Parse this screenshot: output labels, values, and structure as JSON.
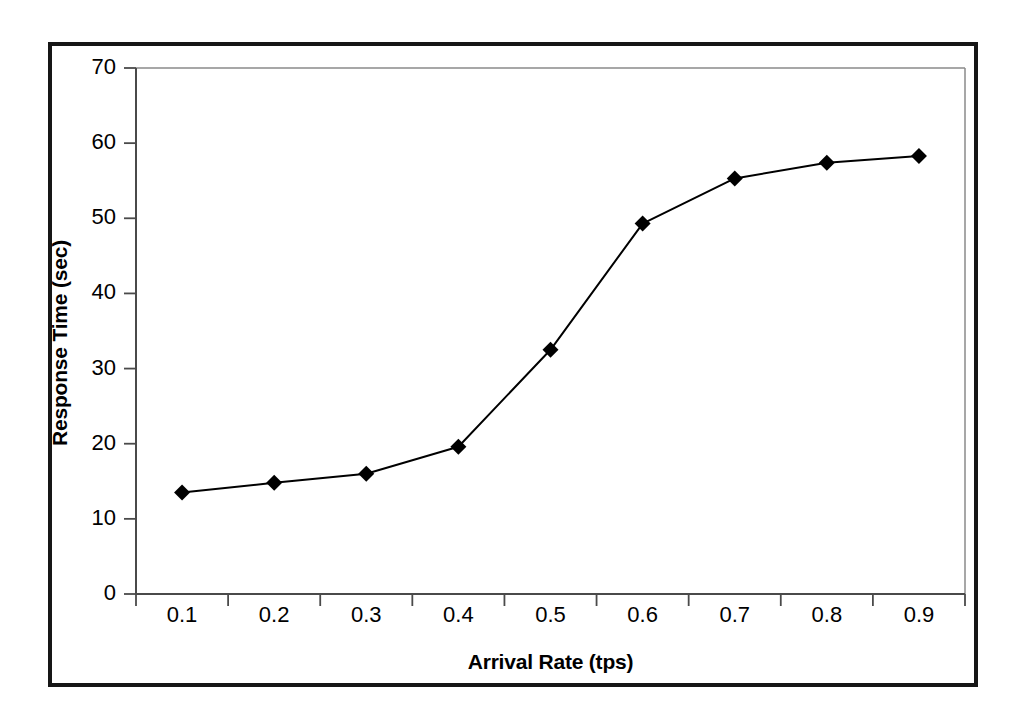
{
  "chart_data": {
    "type": "line",
    "title": "",
    "subtitle": "",
    "xlabel": "Arrival Rate (tps)",
    "ylabel": "Response Time (sec)",
    "categories": [
      "0.1",
      "0.2",
      "0.3",
      "0.4",
      "0.5",
      "0.6",
      "0.7",
      "0.8",
      "0.9"
    ],
    "values": [
      13.5,
      14.8,
      16.0,
      19.6,
      32.5,
      49.3,
      55.3,
      57.4,
      58.3
    ],
    "series": [
      {
        "name": "Response Time",
        "values": [
          13.5,
          14.8,
          16.0,
          19.6,
          32.5,
          49.3,
          55.3,
          57.4,
          58.3
        ]
      }
    ],
    "ylim": [
      0,
      70
    ],
    "y_ticks": [
      0,
      10,
      20,
      30,
      40,
      50,
      60,
      70
    ],
    "y_tick_labels": [
      "0",
      "10",
      "20",
      "30",
      "40",
      "50",
      "60",
      "70"
    ],
    "x_tick_labels": [
      "0.1",
      "0.2",
      "0.3",
      "0.4",
      "0.5",
      "0.6",
      "0.7",
      "0.8",
      "0.9"
    ],
    "grid": false,
    "legend": false,
    "legend_position": "none",
    "marker": "diamond",
    "marker_color": "#000000",
    "line_color": "#000000",
    "plot_background": "#ffffff",
    "frame_color": "#161616",
    "axis_color": "#555555"
  },
  "figure": {
    "background": "#ffffff",
    "border_color": "#161616"
  }
}
